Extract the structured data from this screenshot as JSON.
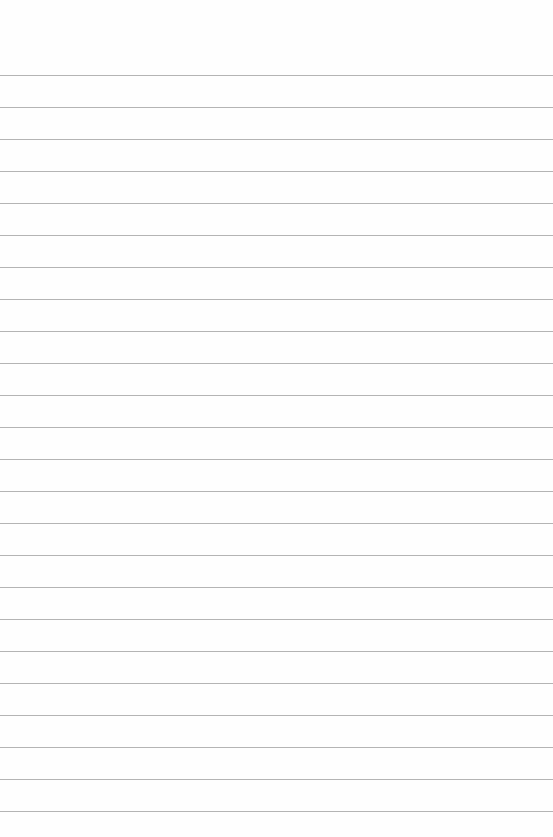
{
  "page": {
    "type": "lined-paper",
    "background_color": "#fefefe",
    "rule_color": "#b4b4b4",
    "first_rule_y": 75,
    "rule_spacing": 32,
    "rule_count": 24
  }
}
